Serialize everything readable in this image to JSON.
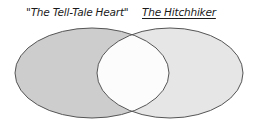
{
  "diagram": {
    "type": "venn",
    "sets": [
      {
        "label": "\"The Tell-Tale Heart\"",
        "fill": "#cdcdcd",
        "underlined": false
      },
      {
        "label": "The Hitchhiker",
        "fill": "#e6e6e6",
        "underlined": true
      }
    ],
    "intersection": {
      "fill": "#fcfcfc"
    },
    "stroke": "#555555"
  }
}
